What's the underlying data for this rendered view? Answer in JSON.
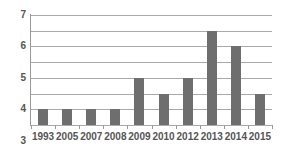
{
  "chart_data": {
    "type": "bar",
    "title": "",
    "xlabel": "",
    "ylabel": "",
    "categories": [
      "1993",
      "2005",
      "2007",
      "2008",
      "2009",
      "2010",
      "2012",
      "2013",
      "2014",
      "2015"
    ],
    "values": [
      1,
      1,
      1,
      1,
      3,
      2,
      3,
      6,
      5,
      2
    ],
    "ylim": [
      0,
      7
    ],
    "ytick_labels": [
      "0",
      "1",
      "2",
      "3",
      "4",
      "5",
      "6",
      "7"
    ],
    "ytick_values": [
      0,
      1,
      2,
      3,
      4,
      5,
      6,
      7
    ],
    "grid": true,
    "legend": false,
    "series": [
      {
        "name": "",
        "values": [
          1,
          1,
          1,
          1,
          3,
          2,
          3,
          6,
          5,
          2
        ]
      }
    ]
  },
  "style": {
    "bar_color": "#6e6e6e",
    "grid_color": "#a9a9a9",
    "axis_color": "#9a9a9a",
    "label_color": "#555555",
    "background": "#ffffff"
  }
}
